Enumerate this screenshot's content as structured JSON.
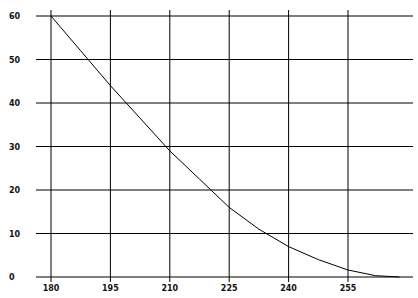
{
  "chart_data": {
    "type": "line",
    "title": "",
    "xlabel": "",
    "ylabel": "",
    "xlim": [
      180,
      265
    ],
    "ylim": [
      0,
      60
    ],
    "grid": true,
    "legend": null,
    "x_ticks": [
      "180",
      "195",
      "210",
      "225",
      "240",
      "255"
    ],
    "y_ticks": [
      "0",
      "10",
      "20",
      "30",
      "40",
      "50",
      "60"
    ],
    "series": [
      {
        "name": "curve",
        "x": [
          180,
          187.5,
          195,
          202.5,
          210,
          217.5,
          225,
          232.5,
          240,
          247.5,
          255,
          262,
          268
        ],
        "values": [
          60,
          52,
          44,
          36.5,
          29,
          22.5,
          16,
          11,
          7,
          4,
          1.6,
          0.3,
          0
        ]
      }
    ],
    "colors": {
      "line": "#000000",
      "grid": "#000000",
      "background": "#ffffff"
    }
  }
}
